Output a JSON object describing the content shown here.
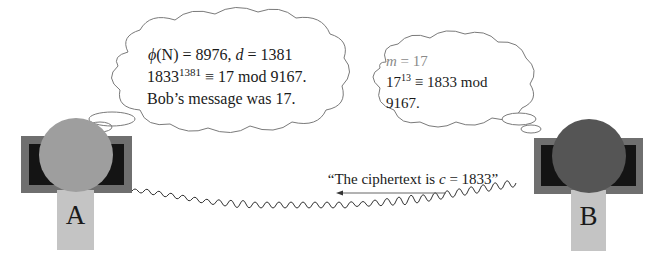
{
  "alice": {
    "label": "A",
    "colors": {
      "screen_frame": "#6f6f6f",
      "screen": "#141414",
      "head": "#9e9e9e",
      "body": "#c4c4c4"
    },
    "thought": {
      "line1_phi": "ϕ",
      "line1_N": "(N) = 8976, ",
      "line1_d": "d",
      "line1_rest": " = 1381",
      "line2_base": "1833",
      "line2_exp": "1381",
      "line2_rest": " ≡ 17 mod 9167.",
      "line3": "Bob’s message was 17."
    }
  },
  "bob": {
    "label": "B",
    "colors": {
      "screen_frame": "#6f6f6f",
      "screen": "#141414",
      "head": "#555555",
      "body": "#c4c4c4"
    },
    "thought": {
      "line1_m": "m",
      "line1_rest": " = 17",
      "line2_base": "17",
      "line2_exp": "13",
      "line2_rest": " ≡ 1833 mod",
      "line3": "9167."
    }
  },
  "channel": {
    "message_open": "“The ciphertext is ",
    "message_var": "c",
    "message_close": " = 1833”",
    "arrow_direction": "left",
    "wire_color": "#333333",
    "arrow_color": "#666666"
  }
}
